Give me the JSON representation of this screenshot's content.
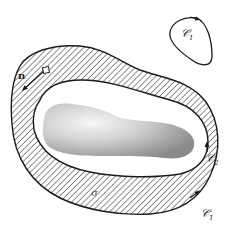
{
  "figure": {
    "colors": {
      "stroke": "#1a1a1a",
      "hatch": "#333333",
      "background": "#ffffff",
      "body_light": "#f2f2f2",
      "body_dark": "#8c8c8c"
    },
    "labels": {
      "small_curve": {
        "main": "𝒞",
        "sub": "1"
      },
      "outer_curve": {
        "main": "𝒞",
        "sub": "1"
      },
      "inner_curve": {
        "main": "𝒞",
        "sub": "2"
      },
      "normal": "n",
      "region": "σ"
    }
  }
}
